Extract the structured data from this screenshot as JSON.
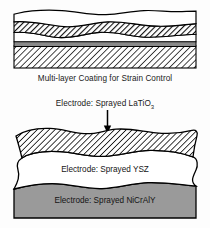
{
  "figure": {
    "top_diagram": {
      "name": "multi-layer-coating-cross-section",
      "caption": "Multi-layer Coating for Strain Control",
      "layers": [
        {
          "id": "top-white-layer",
          "fill": "white",
          "pattern": "none"
        },
        {
          "id": "dense-hatch-layer",
          "fill": "white",
          "pattern": "diagonal-hatch-fine"
        },
        {
          "id": "mid-white-layer",
          "fill": "white",
          "pattern": "none"
        },
        {
          "id": "thin-gray-layer",
          "fill": "#8a8a8a",
          "pattern": "solid"
        },
        {
          "id": "substrate-hatch-layer",
          "fill": "white",
          "pattern": "diagonal-hatch-coarse"
        }
      ]
    },
    "bottom_diagram": {
      "name": "sprayed-electrode-stack",
      "annotation": {
        "text": "Electrode: Sprayed LaTiO",
        "subscript": "3",
        "pointer": "down-arrow"
      },
      "layers": [
        {
          "id": "latio3-layer",
          "label": "",
          "fill": "white",
          "pattern": "diagonal-hatch-coarse"
        },
        {
          "id": "ysz-layer",
          "label": "Electrode: Sprayed YSZ",
          "fill": "#ffffff",
          "pattern": "none"
        },
        {
          "id": "nicraly-layer",
          "label": "Electrode: Sprayed NiCrAlY",
          "fill": "#9a9a9a",
          "pattern": "solid"
        }
      ]
    }
  },
  "colors": {
    "outline": "#000000",
    "gray_thin_band": "#8a8a8a",
    "gray_bottom_layer": "#9a9a9a",
    "background": "#fdfdfd",
    "text": "#141414"
  }
}
